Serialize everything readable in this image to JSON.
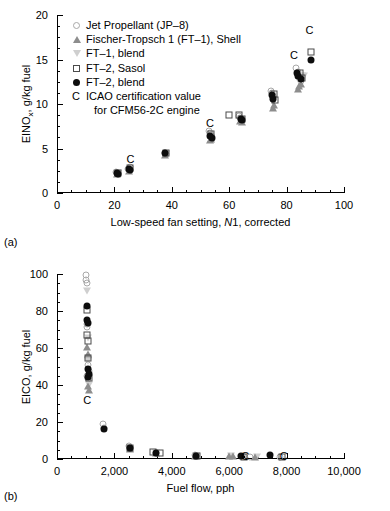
{
  "figure": {
    "panel_a_label": "(a)",
    "panel_b_label": "(b)"
  },
  "legend": {
    "items": [
      {
        "marker": "open-circle",
        "label": "Jet Propellant (JP–8)"
      },
      {
        "marker": "up-triangle",
        "label": "Fischer-Tropsch 1 (FT–1), Shell"
      },
      {
        "marker": "down-triangle",
        "label": "FT–1, blend"
      },
      {
        "marker": "open-square",
        "label": "FT–2, Sasol"
      },
      {
        "marker": "filled-circle",
        "label": "FT–2, blend"
      },
      {
        "marker": "letter-c",
        "label": "ICAO certification value"
      }
    ],
    "continuation": "for CFM56-2C engine",
    "c_letter": "C"
  },
  "chart_data": [
    {
      "type": "scatter",
      "panel": "(a)",
      "title": "",
      "xlabel": "Low-speed fan setting, N1, corrected",
      "ylabel": "EINOx, g/kg fuel",
      "ylabel_main": "EINO",
      "ylabel_sub": "x",
      "ylabel_rest": ", g/kg fuel",
      "xlim": [
        0,
        100
      ],
      "ylim": [
        0,
        20
      ],
      "xticks": [
        0,
        20,
        40,
        60,
        80,
        100
      ],
      "yticks": [
        0,
        5,
        10,
        15,
        20
      ],
      "xtick_labels": [
        "0",
        "20",
        "40",
        "60",
        "80",
        "100"
      ],
      "ytick_labels": [
        "0",
        "5",
        "10",
        "15",
        "20"
      ],
      "xminor_step": 5,
      "yminor_step": 1.25,
      "grid": false,
      "legend_position": "upper-left",
      "series": [
        {
          "name": "Jet Propellant (JP-8)",
          "marker": "open-circle",
          "points": [
            [
              20.7,
              2.35
            ],
            [
              21.2,
              2.15
            ],
            [
              24.9,
              2.75
            ],
            [
              25.4,
              2.95
            ],
            [
              37.6,
              4.55
            ],
            [
              37.9,
              4.4
            ],
            [
              52.9,
              7.0
            ],
            [
              53.2,
              6.75
            ],
            [
              53.6,
              6.5
            ],
            [
              63.3,
              8.6
            ],
            [
              63.8,
              8.45
            ],
            [
              64.2,
              8.3
            ],
            [
              74.6,
              11.5
            ],
            [
              74.9,
              11.2
            ],
            [
              75.3,
              10.9
            ],
            [
              83.3,
              14.0
            ],
            [
              83.8,
              13.6
            ],
            [
              84.2,
              13.2
            ],
            [
              84.7,
              12.9
            ],
            [
              85.1,
              12.6
            ]
          ]
        },
        {
          "name": "Fischer-Tropsch 1 (FT-1), Shell",
          "marker": "up-triangle",
          "points": [
            [
              21.0,
              2.1
            ],
            [
              25.2,
              2.5
            ],
            [
              37.8,
              4.3
            ],
            [
              53.4,
              5.9
            ],
            [
              53.7,
              6.1
            ],
            [
              63.9,
              8.1
            ],
            [
              64.3,
              8.0
            ],
            [
              75.1,
              9.6
            ],
            [
              75.5,
              9.9
            ],
            [
              84.0,
              11.7
            ],
            [
              84.4,
              12.0
            ],
            [
              85.0,
              12.3
            ]
          ]
        },
        {
          "name": "FT-1, blend",
          "marker": "down-triangle",
          "points": [
            [
              21.1,
              2.2
            ],
            [
              25.3,
              2.6
            ],
            [
              37.9,
              4.35
            ],
            [
              53.5,
              6.2
            ],
            [
              64.0,
              8.2
            ],
            [
              75.2,
              10.2
            ],
            [
              84.3,
              12.6
            ],
            [
              85.3,
              13.1
            ],
            [
              86.0,
              13.2
            ]
          ]
        },
        {
          "name": "FT-2, Sasol",
          "marker": "open-square",
          "points": [
            [
              21.3,
              2.3
            ],
            [
              25.5,
              2.85
            ],
            [
              38.0,
              4.5
            ],
            [
              53.8,
              6.6
            ],
            [
              59.9,
              8.8
            ],
            [
              63.5,
              8.75
            ],
            [
              64.5,
              8.35
            ],
            [
              75.6,
              11.1
            ],
            [
              76.0,
              10.5
            ],
            [
              84.6,
              13.5
            ],
            [
              85.4,
              12.9
            ],
            [
              88.5,
              15.8
            ]
          ]
        },
        {
          "name": "FT-2, blend",
          "marker": "filled-circle",
          "points": [
            [
              20.9,
              2.25
            ],
            [
              21.4,
              2.1
            ],
            [
              25.1,
              2.7
            ],
            [
              25.6,
              2.6
            ],
            [
              37.7,
              4.5
            ],
            [
              53.3,
              6.45
            ],
            [
              53.9,
              6.2
            ],
            [
              64.1,
              8.35
            ],
            [
              64.6,
              8.2
            ],
            [
              74.8,
              11.0
            ],
            [
              75.4,
              10.6
            ],
            [
              83.6,
              13.5
            ],
            [
              84.1,
              13.2
            ],
            [
              84.9,
              12.8
            ],
            [
              88.4,
              14.9
            ]
          ]
        },
        {
          "name": "ICAO certification value",
          "marker": "letter-c",
          "points": [
            [
              25.6,
              3.85
            ],
            [
              53.3,
              7.85
            ],
            [
              82.6,
              15.5
            ],
            [
              88.0,
              18.3
            ]
          ]
        }
      ]
    },
    {
      "type": "scatter",
      "panel": "(b)",
      "title": "",
      "xlabel": "Fuel flow, pph",
      "ylabel": "EICO, g/kg fuel",
      "xlim": [
        0,
        10000
      ],
      "ylim": [
        0,
        100
      ],
      "xticks": [
        0,
        2000,
        4000,
        6000,
        8000,
        10000
      ],
      "yticks": [
        0,
        20,
        40,
        60,
        80,
        100
      ],
      "xtick_labels": [
        "0",
        "2,000",
        "4,000",
        "6,000",
        "8,000",
        "10,000"
      ],
      "ytick_labels": [
        "0",
        "20",
        "40",
        "60",
        "80",
        "100"
      ],
      "xminor_step": 500,
      "yminor_step": 5,
      "grid": false,
      "legend_position": "none",
      "series": [
        {
          "name": "Jet Propellant (JP-8)",
          "marker": "open-circle",
          "points": [
            [
              1000,
              99.5
            ],
            [
              1020,
              97.0
            ],
            [
              1040,
              95.0
            ],
            [
              1060,
              73.0
            ],
            [
              1030,
              71.5
            ],
            [
              1080,
              51.0
            ],
            [
              1100,
              47.5
            ],
            [
              1060,
              45.0
            ],
            [
              1090,
              43.5
            ],
            [
              1620,
              19.0
            ],
            [
              1650,
              17.0
            ],
            [
              2520,
              7.0
            ],
            [
              2560,
              6.2
            ],
            [
              3450,
              3.4
            ],
            [
              4820,
              2.0
            ],
            [
              6480,
              1.6
            ],
            [
              6720,
              1.3
            ],
            [
              7780,
              1.2
            ]
          ]
        },
        {
          "name": "Fischer-Tropsch 1 (FT-1), Shell",
          "marker": "up-triangle",
          "points": [
            [
              1060,
              60.5
            ],
            [
              1070,
              57.0
            ],
            [
              1090,
              39.5
            ],
            [
              1100,
              37.5
            ],
            [
              2530,
              5.4
            ],
            [
              3440,
              3.0
            ],
            [
              4800,
              1.6
            ],
            [
              6000,
              1.5
            ],
            [
              6120,
              1.4
            ],
            [
              6900,
              1.1
            ]
          ]
        },
        {
          "name": "FT-1, blend",
          "marker": "down-triangle",
          "points": [
            [
              1040,
              91.0
            ],
            [
              1070,
              65.5
            ],
            [
              1090,
              53.0
            ],
            [
              1100,
              40.0
            ],
            [
              2540,
              5.6
            ],
            [
              3460,
              3.1
            ],
            [
              4840,
              1.7
            ],
            [
              6060,
              1.4
            ],
            [
              6960,
              1.2
            ]
          ]
        },
        {
          "name": "FT-2, Sasol",
          "marker": "open-square",
          "points": [
            [
              1050,
              80.5
            ],
            [
              1060,
              67.0
            ],
            [
              1080,
              64.0
            ],
            [
              1090,
              54.5
            ],
            [
              1100,
              44.0
            ],
            [
              2550,
              5.8
            ],
            [
              3330,
              3.6
            ],
            [
              3580,
              3.5
            ],
            [
              4870,
              1.8
            ],
            [
              6500,
              1.3
            ],
            [
              7850,
              1.1
            ]
          ]
        },
        {
          "name": "FT-2, blend",
          "marker": "filled-circle",
          "points": [
            [
              1050,
              82.5
            ],
            [
              1060,
              75.0
            ],
            [
              1070,
              73.5
            ],
            [
              1090,
              48.5
            ],
            [
              1100,
              46.0
            ],
            [
              1080,
              44.5
            ],
            [
              1640,
              16.2
            ],
            [
              2550,
              6.0
            ],
            [
              3460,
              3.2
            ],
            [
              4830,
              1.7
            ],
            [
              6420,
              1.5
            ],
            [
              7420,
              2.0
            ]
          ]
        },
        {
          "name": "ICAO certification value",
          "marker": "letter-c",
          "points": [
            [
              1050,
              32.0
            ],
            [
              6560,
              1.5
            ],
            [
              7900,
              1.4
            ]
          ]
        }
      ]
    }
  ]
}
